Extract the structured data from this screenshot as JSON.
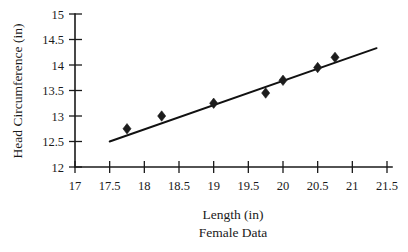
{
  "chart_data": {
    "type": "scatter",
    "title": "",
    "xlabel": "Length (in)",
    "ylabel": "Head Circumference (in)",
    "caption": "Female Data",
    "xlim": [
      17,
      21.5
    ],
    "ylim": [
      12,
      15
    ],
    "grid": false,
    "legend": "none",
    "xticks": [
      "17",
      "17.5",
      "18",
      "18.5",
      "19",
      "19.5",
      "20",
      "20.5",
      "21",
      "21.5"
    ],
    "xtick_values": [
      17,
      17.5,
      18,
      18.5,
      19,
      19.5,
      20,
      20.5,
      21,
      21.5
    ],
    "yticks": [
      "12",
      "12.5",
      "13",
      "13.5",
      "14",
      "14.5",
      "15"
    ],
    "ytick_values": [
      12,
      12.5,
      13,
      13.5,
      14,
      14.5,
      15
    ],
    "points": [
      {
        "x": 17.75,
        "y": 12.75
      },
      {
        "x": 18.25,
        "y": 13.0
      },
      {
        "x": 19.0,
        "y": 13.25
      },
      {
        "x": 19.75,
        "y": 13.45
      },
      {
        "x": 20.0,
        "y": 13.7
      },
      {
        "x": 20.5,
        "y": 13.95
      },
      {
        "x": 20.75,
        "y": 14.15
      }
    ],
    "marker_shape": "diamond",
    "marker_color": "#1c1c1c",
    "trend_line": {
      "x_start": 17.5,
      "y_start": 12.5,
      "x_end": 21.35,
      "y_end": 14.33,
      "color": "#111111"
    }
  },
  "axis_titles": {
    "y": "Head Circumference (in)",
    "x": "Length (in)",
    "sub": "Female Data"
  }
}
